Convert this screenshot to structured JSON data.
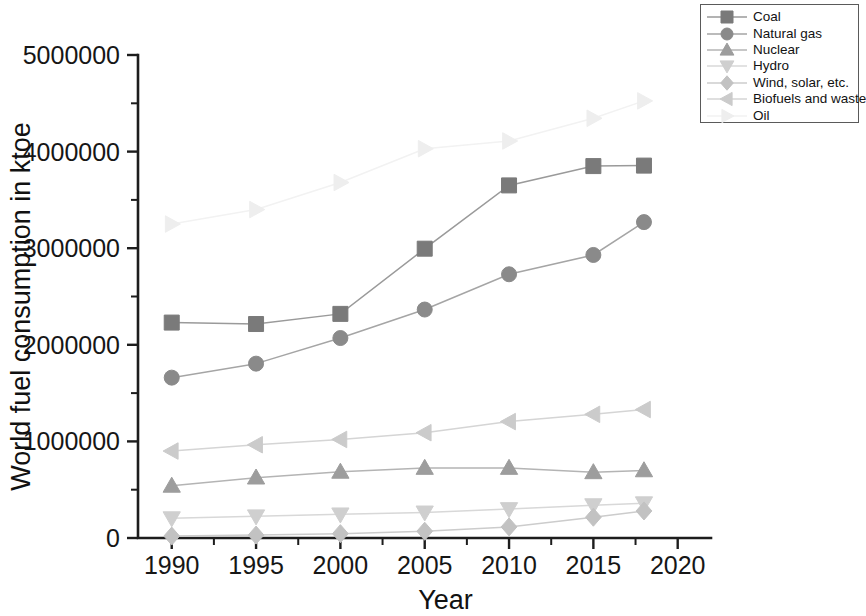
{
  "chart_data": {
    "type": "line",
    "title": "",
    "xlabel": "Year",
    "ylabel": "World fuel consumption in ktoe",
    "x": [
      1990,
      1995,
      2000,
      2005,
      2010,
      2015,
      2018
    ],
    "xlim": [
      1988,
      2021.5
    ],
    "ylim": [
      0,
      5000000
    ],
    "xticks": [
      1990,
      1995,
      2000,
      2005,
      2010,
      2015,
      2020
    ],
    "xtick_labels": [
      "1990",
      "1995",
      "2000",
      "2005",
      "2010",
      "2015",
      "2020"
    ],
    "yticks": [
      0,
      1000000,
      2000000,
      3000000,
      4000000,
      5000000
    ],
    "ytick_labels": [
      "0",
      "1000000",
      "2000000",
      "3000000",
      "4000000",
      "5000000"
    ],
    "x_minor_interval": 2.5,
    "y_minor_interval": 500000,
    "grid": false,
    "legend_position": "top-right",
    "series": [
      {
        "name": "Coal",
        "marker": "square",
        "color": "#7a7a7a",
        "line_color": "#9a9a9a",
        "values": [
          2230000,
          2215000,
          2320000,
          2995000,
          3650000,
          3850000,
          3855000
        ]
      },
      {
        "name": "Natural gas",
        "marker": "circle",
        "color": "#8a8a8a",
        "line_color": "#a5a5a5",
        "values": [
          1660000,
          1805000,
          2070000,
          2365000,
          2730000,
          2930000,
          3270000
        ]
      },
      {
        "name": "Nuclear",
        "marker": "triangle-up",
        "color": "#9d9d9d",
        "line_color": "#b4b4b4",
        "values": [
          540000,
          625000,
          685000,
          725000,
          725000,
          680000,
          700000
        ]
      },
      {
        "name": "Hydro",
        "marker": "triangle-down",
        "color": "#cfcfcf",
        "line_color": "#d8d8d8",
        "values": [
          205000,
          225000,
          245000,
          265000,
          300000,
          340000,
          360000
        ]
      },
      {
        "name": "Wind, solar, etc.",
        "marker": "diamond",
        "color": "#c2c2c2",
        "line_color": "#cccccc",
        "values": [
          20000,
          30000,
          45000,
          70000,
          115000,
          215000,
          280000
        ]
      },
      {
        "name": "Biofuels and waste",
        "marker": "triangle-left",
        "color": "#cbcbcb",
        "line_color": "#d5d5d5",
        "values": [
          900000,
          965000,
          1020000,
          1090000,
          1205000,
          1280000,
          1330000
        ]
      },
      {
        "name": "Oil",
        "marker": "triangle-right",
        "color": "#eeeeee",
        "line_color": "#f2f2f2",
        "values": [
          3250000,
          3400000,
          3680000,
          4030000,
          4110000,
          4345000,
          4525000
        ]
      }
    ]
  },
  "legend": {
    "items": [
      {
        "label": "Coal"
      },
      {
        "label": "Natural gas"
      },
      {
        "label": "Nuclear"
      },
      {
        "label": "Hydro"
      },
      {
        "label": "Wind, solar, etc."
      },
      {
        "label": "Biofuels and waste"
      },
      {
        "label": "Oil"
      }
    ]
  },
  "axes": {
    "x_title": "Year",
    "y_title": "World fuel consumption in ktoe"
  }
}
